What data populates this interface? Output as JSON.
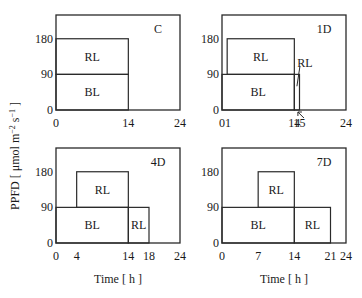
{
  "figure": {
    "ylabel": "PPFD [ μmol m⁻² s⁻¹ ]",
    "ylabel_parts": {
      "main": "PPFD [ μmol m",
      "sup1": "−2",
      "mid": " s",
      "sup2": "−1",
      "end": " ]"
    },
    "xlabel": "Time [ h ]",
    "line_color": "#2a2a2a"
  },
  "chart_data": [
    {
      "type": "diagram",
      "id": "C",
      "title": "C",
      "xticks": [
        "0",
        "14",
        "24"
      ],
      "yticks": [
        "0",
        "90",
        "180"
      ],
      "xrange": [
        0,
        24
      ],
      "yrange": [
        0,
        240
      ],
      "blocks": [
        {
          "label": "BL",
          "x0": 0,
          "x1": 14,
          "y0": 0,
          "y1": 90
        },
        {
          "label": "RL",
          "x0": 0,
          "x1": 14,
          "y0": 90,
          "y1": 180
        }
      ]
    },
    {
      "type": "diagram",
      "id": "1D",
      "title": "1D",
      "xticks": [
        "01",
        "14",
        "15",
        "24"
      ],
      "yticks": [
        "0",
        "90",
        "180"
      ],
      "xrange": [
        0,
        24
      ],
      "yrange": [
        0,
        240
      ],
      "blocks": [
        {
          "label": "BL",
          "x0": 0,
          "x1": 14,
          "y0": 0,
          "y1": 90
        },
        {
          "label": "RL",
          "x0": 1,
          "x1": 14,
          "y0": 90,
          "y1": 180
        },
        {
          "label": "RL",
          "x0": 14,
          "x1": 15,
          "y0": 0,
          "y1": 90,
          "annotated": true
        }
      ]
    },
    {
      "type": "diagram",
      "id": "4D",
      "title": "4D",
      "xticks": [
        "0",
        "4",
        "14",
        "18",
        "24"
      ],
      "yticks": [
        "0",
        "90",
        "180"
      ],
      "xrange": [
        0,
        24
      ],
      "yrange": [
        0,
        240
      ],
      "blocks": [
        {
          "label": "BL",
          "x0": 0,
          "x1": 14,
          "y0": 0,
          "y1": 90
        },
        {
          "label": "RL",
          "x0": 4,
          "x1": 14,
          "y0": 90,
          "y1": 180
        },
        {
          "label": "RL",
          "x0": 14,
          "x1": 18,
          "y0": 0,
          "y1": 90
        }
      ]
    },
    {
      "type": "diagram",
      "id": "7D",
      "title": "7D",
      "xticks": [
        "0",
        "7",
        "14",
        "21",
        "24"
      ],
      "yticks": [
        "0",
        "90",
        "180"
      ],
      "xrange": [
        0,
        24
      ],
      "yrange": [
        0,
        240
      ],
      "blocks": [
        {
          "label": "BL",
          "x0": 0,
          "x1": 14,
          "y0": 0,
          "y1": 90
        },
        {
          "label": "RL",
          "x0": 7,
          "x1": 14,
          "y0": 90,
          "y1": 180
        },
        {
          "label": "RL",
          "x0": 14,
          "x1": 21,
          "y0": 0,
          "y1": 90
        }
      ]
    }
  ]
}
